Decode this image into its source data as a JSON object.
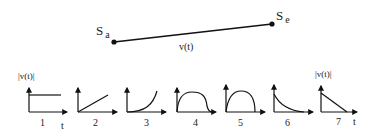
{
  "path": {
    "start_label": "S",
    "start_sub": "a",
    "end_label": "S",
    "end_sub": "e",
    "edge_label": "v(t)"
  },
  "axes": {
    "y_label": "|v(t)|",
    "x_label": "t"
  },
  "profiles": [
    {
      "number": "1",
      "shape": "constant"
    },
    {
      "number": "2",
      "shape": "linear-increasing"
    },
    {
      "number": "3",
      "shape": "convex-increasing"
    },
    {
      "number": "4",
      "shape": "plateau-bump"
    },
    {
      "number": "5",
      "shape": "arc"
    },
    {
      "number": "6",
      "shape": "decaying"
    },
    {
      "number": "7",
      "shape": "linear-decreasing"
    }
  ],
  "colors": {
    "ink": "#111111",
    "background": "#ffffff"
  }
}
